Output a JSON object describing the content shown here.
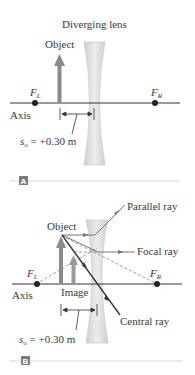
{
  "panel_a": {
    "title": "Diverging lens",
    "object_label": "Object",
    "focal_left": "F",
    "focal_left_sub": "L",
    "focal_right": "F",
    "focal_right_sub": "R",
    "axis_label": "Axis",
    "distance_prefix": "s",
    "distance_sub": "o",
    "distance_value": " = +0.30 m",
    "badge": "A"
  },
  "panel_b": {
    "object_label": "Object",
    "image_label": "Image",
    "parallel_ray": "Parallel ray",
    "focal_ray": "Focal ray",
    "central_ray": "Central ray",
    "focal_left": "F",
    "focal_left_sub": "L",
    "focal_right": "F",
    "focal_right_sub": "R",
    "axis_label": "Axis",
    "distance_prefix": "s",
    "distance_sub": "o",
    "distance_value": " = +0.30 m",
    "badge": "B"
  },
  "colors": {
    "lens_fill": "#d9d9dc",
    "object_arrow": "#8a8a8a",
    "axis": "#333333",
    "badge_bg": "#7d7d7d",
    "divider": "#cfcfcf"
  }
}
